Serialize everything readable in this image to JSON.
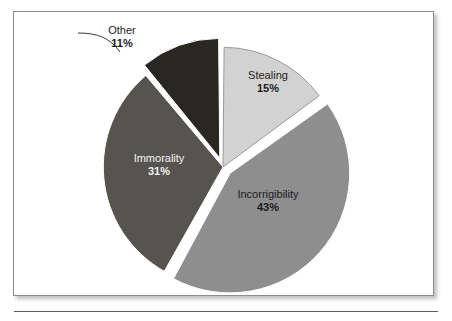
{
  "figure": {
    "background_color": "#ffffff",
    "border_color": "#8d8d8d"
  },
  "chart_data": {
    "type": "pie",
    "title": "",
    "subtitle": "",
    "xlabel": "",
    "ylabel": "",
    "legend_position": "none",
    "grid": false,
    "units": "percent",
    "categories": [
      "Stealing",
      "Incorrigibility",
      "Immorality",
      "Other"
    ],
    "values": [
      15,
      43,
      31,
      11
    ],
    "value_labels": [
      "15%",
      "43%",
      "31%",
      "11%"
    ],
    "start_angle_deg": 0,
    "direction": "clockwise",
    "slices": [
      {
        "label": "Stealing",
        "value": 15,
        "value_label": "15%",
        "color": "#d2d2d2",
        "text_color": "#1b1b1b",
        "exploded": false,
        "label_placement": "inside"
      },
      {
        "label": "Incorrigibility",
        "value": 43,
        "value_label": "43%",
        "color": "#8e8e8e",
        "text_color": "#1b1b1b",
        "exploded": true,
        "label_placement": "inside"
      },
      {
        "label": "Immorality",
        "value": 31,
        "value_label": "31%",
        "color": "#575450",
        "text_color": "#f2f2f2",
        "exploded": false,
        "label_placement": "inside"
      },
      {
        "label": "Other",
        "value": 11,
        "value_label": "11%",
        "color": "#2a2622",
        "text_color": "#1b1b1b",
        "exploded": true,
        "label_placement": "outside-with-leader"
      }
    ]
  }
}
